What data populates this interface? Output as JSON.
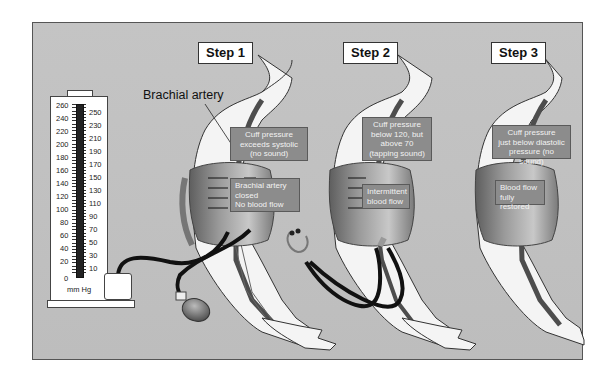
{
  "steps": [
    {
      "title": "Step 1",
      "callout_top": [
        "Cuff pressure",
        "exceeds systolic",
        "(no sound)"
      ],
      "callout_bottom": [
        "Brachial artery",
        "closed",
        "No blood flow"
      ]
    },
    {
      "title": "Step 2",
      "callout_top": [
        "Cuff pressure",
        "below 120, but",
        "above 70",
        "(tapping sound)"
      ],
      "callout_bottom": [
        "Intermittent",
        "blood flow"
      ]
    },
    {
      "title": "Step 3",
      "callout_top": [
        "Cuff pressure",
        "just below diastolic",
        "pressure (no sound)"
      ],
      "callout_bottom": [
        "Blood flow",
        "fully restored"
      ]
    }
  ],
  "labels": {
    "brachial_artery": "Brachial artery"
  },
  "gauge": {
    "unit": "mm Hg",
    "left_scale": [
      "260",
      "240",
      "220",
      "200",
      "180",
      "160",
      "140",
      "120",
      "100",
      "80",
      "60",
      "40",
      "20",
      "0"
    ],
    "right_scale": [
      "250",
      "230",
      "210",
      "190",
      "170",
      "150",
      "130",
      "110",
      "90",
      "70",
      "50",
      "30",
      "10"
    ],
    "mercury_level": 200
  },
  "colors": {
    "background": "#c0c0c0",
    "callout": "#8c8c8c",
    "artery": "#555555",
    "cuff": "#7a7a7a",
    "tubing": "#111111"
  }
}
